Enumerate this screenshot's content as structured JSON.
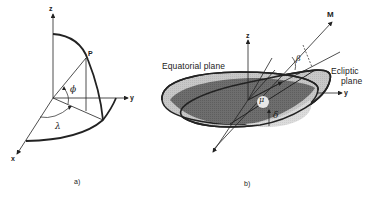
{
  "figure": {
    "panel_a": {
      "caption": "a)",
      "axes": {
        "z": "z",
        "y": "y",
        "x": "x"
      },
      "point_label": "P",
      "angles": {
        "latitude": "ϕ",
        "longitude": "λ"
      }
    },
    "panel_b": {
      "caption": "b)",
      "axes": {
        "z": "z",
        "y": "y",
        "m": "M"
      },
      "planes": {
        "equatorial": "Equatorial plane",
        "ecliptic_line1": "Ecliptic",
        "ecliptic_line2": "plane"
      },
      "angles": {
        "beta": "β",
        "delta": "δ",
        "mu": "μ"
      }
    },
    "colors": {
      "line": "#222222",
      "dark_fill": "#6e6e6e",
      "light_fill": "#c4c4c4",
      "lighter_fill": "#d9d9d9",
      "background": "#ffffff"
    }
  }
}
